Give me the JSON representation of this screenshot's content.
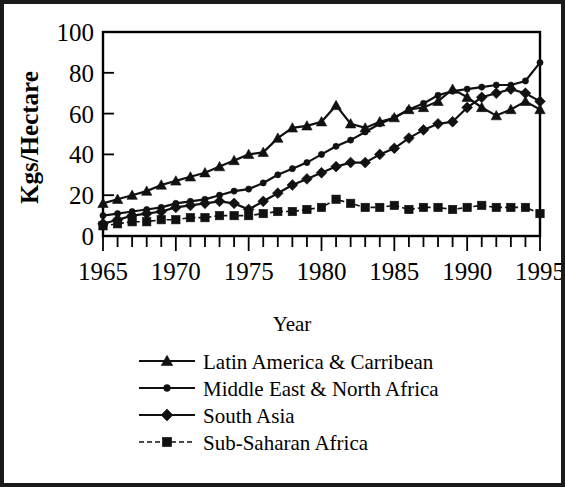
{
  "chart_data": {
    "type": "line",
    "title": "",
    "xlabel": "Year",
    "ylabel": "Kgs/Hectare",
    "xlim": [
      1965,
      1995
    ],
    "ylim": [
      0,
      100
    ],
    "grid": false,
    "legend_position": "bottom",
    "x_tick_labels": [
      "1965",
      "1970",
      "1975",
      "1980",
      "1985",
      "1990",
      "1995"
    ],
    "x_tick_values": [
      1965,
      1970,
      1975,
      1980,
      1985,
      1990,
      1995
    ],
    "y_tick_labels": [
      "0",
      "20",
      "40",
      "60",
      "80",
      "100"
    ],
    "y_tick_values": [
      0,
      20,
      40,
      60,
      80,
      100
    ],
    "x": [
      1965,
      1966,
      1967,
      1968,
      1969,
      1970,
      1971,
      1972,
      1973,
      1974,
      1975,
      1976,
      1977,
      1978,
      1979,
      1980,
      1981,
      1982,
      1983,
      1984,
      1985,
      1986,
      1987,
      1988,
      1989,
      1990,
      1991,
      1992,
      1993,
      1994,
      1995
    ],
    "series": [
      {
        "name": "Latin America & Carribean",
        "marker": "triangle",
        "line_style": "solid",
        "values": [
          16,
          18,
          20,
          22,
          25,
          27,
          29,
          31,
          34,
          37,
          40,
          41,
          48,
          53,
          54,
          56,
          64,
          55,
          53,
          56,
          58,
          62,
          63,
          66,
          72,
          68,
          63,
          59,
          62,
          66,
          62
        ]
      },
      {
        "name": "Middle East & North Africa",
        "marker": "circle",
        "line_style": "solid",
        "values": [
          10,
          11,
          12,
          13,
          14,
          16,
          17,
          18,
          20,
          22,
          23,
          26,
          30,
          33,
          36,
          40,
          44,
          47,
          51,
          55,
          58,
          62,
          65,
          69,
          71,
          72,
          73,
          74,
          74,
          76,
          85
        ]
      },
      {
        "name": "South Asia",
        "marker": "diamond",
        "line_style": "solid",
        "values": [
          6,
          8,
          10,
          11,
          12,
          14,
          15,
          16,
          17,
          16,
          13,
          17,
          21,
          25,
          28,
          31,
          34,
          36,
          36,
          40,
          43,
          48,
          52,
          55,
          56,
          63,
          68,
          70,
          72,
          70,
          66
        ]
      },
      {
        "name": "Sub-Saharan Africa",
        "marker": "square",
        "line_style": "dashed",
        "values": [
          5,
          6,
          7,
          7,
          8,
          8,
          9,
          9,
          10,
          10,
          10,
          11,
          12,
          12,
          13,
          14,
          18,
          16,
          14,
          14,
          15,
          13,
          14,
          14,
          13,
          14,
          15,
          14,
          14,
          14,
          11
        ]
      }
    ]
  },
  "legend": {
    "entries": [
      {
        "label": "Latin America & Carribean"
      },
      {
        "label": "Middle East & North Africa"
      },
      {
        "label": "South Asia"
      },
      {
        "label": "Sub-Saharan Africa"
      }
    ]
  },
  "colors": {
    "ink": "#111111",
    "frame": "#1a1a1a",
    "background": "#ffffff"
  }
}
